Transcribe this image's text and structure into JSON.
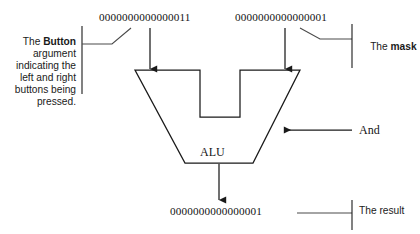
{
  "diagram": {
    "stroke_color": "#1a1a1a",
    "background_color": "#ffffff"
  },
  "operands": {
    "left": {
      "value": "0000000000000011",
      "callout_prefix": "The ",
      "callout_emphasis": "Button",
      "callout_rest": "\nargument\nindicating the\nleft and right\nbuttons being\npressed."
    },
    "right": {
      "value": "0000000000000001",
      "callout_prefix": "The ",
      "callout_emphasis": "mask",
      "callout_rest": ""
    }
  },
  "alu": {
    "label": "ALU",
    "operation_label": "And"
  },
  "result": {
    "value": "0000000000000001",
    "callout": "The result"
  }
}
